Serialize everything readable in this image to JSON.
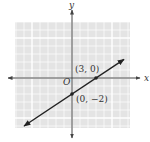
{
  "chart_data": {
    "type": "line",
    "title": "",
    "xlabel": "x",
    "ylabel": "y",
    "origin_label": "O",
    "xlim": [
      -7,
      7
    ],
    "ylim": [
      -6,
      7
    ],
    "grid": true,
    "series": [
      {
        "name": "line through (3, 0) and (0, -2)",
        "slope": 0.6667,
        "intercept": -2,
        "x_range": [
          -6,
          6.5
        ]
      }
    ],
    "points": [
      {
        "x": 3,
        "y": 0,
        "label": "(3, 0)"
      },
      {
        "x": 0,
        "y": -2,
        "label": "(0, −2)"
      }
    ]
  },
  "colors": {
    "grid_background": "#e4e4e4",
    "grid_line": "#ffffff",
    "axis": "#444444",
    "line": "#222222"
  }
}
